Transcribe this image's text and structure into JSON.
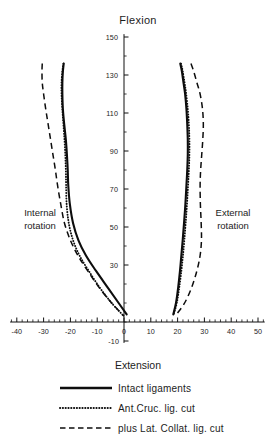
{
  "figure": {
    "title": "Flexion",
    "bottom_axis_label": "Extension",
    "left_region_label_line1": "Internal",
    "left_region_label_line2": "rotation",
    "right_region_label_line1": "External",
    "right_region_label_line2": "rotation",
    "caption": ""
  },
  "legend": {
    "entries": [
      {
        "label": "Intact ligaments",
        "style": "solid",
        "color": "#0d0d0d"
      },
      {
        "label": "Ant.Cruc. lig. cut",
        "style": "dotted",
        "color": "#0d0d0d"
      },
      {
        "label": "plus Lat. Collat. lig. cut",
        "style": "dashed",
        "color": "#0d0d0d"
      }
    ]
  },
  "axes": {
    "x_label": "Extension",
    "x_ticks": [
      "-40",
      "-30",
      "-20",
      "-10",
      "0",
      "10",
      "20",
      "30",
      "40",
      "50"
    ],
    "x_tick_values": [
      -40,
      -30,
      -20,
      -10,
      0,
      10,
      20,
      30,
      40,
      50
    ],
    "x_minor_step": 2,
    "x_range": [
      -44,
      54
    ],
    "y_label": "Flexion",
    "y_ticks": [
      "150",
      "130",
      "110",
      "90",
      "70",
      "50",
      "30",
      "-10"
    ],
    "y_tick_values": [
      150,
      130,
      110,
      90,
      70,
      50,
      30,
      -10
    ],
    "y_minor_step": 10,
    "y_range": [
      -12,
      152
    ],
    "grid": false
  },
  "chart_data": {
    "type": "line",
    "title": "Flexion",
    "xlabel": "Extension",
    "ylabel": "Flexion",
    "xlim": [
      -44,
      54
    ],
    "ylim": [
      -12,
      152
    ],
    "x_ticks": [
      -40,
      -30,
      -20,
      -10,
      0,
      10,
      20,
      30,
      40,
      50
    ],
    "y_ticks": [
      30,
      50,
      70,
      90,
      110,
      130,
      150
    ],
    "grid": false,
    "legend_position": "below",
    "x_axis_note": "Rotation in degrees; negative = internal rotation, positive = external rotation",
    "y_axis_note": "Knee flexion angle in degrees",
    "annotations": [
      {
        "text": "Internal rotation",
        "x": -33,
        "y": 62
      },
      {
        "text": "External rotation",
        "x": 36,
        "y": 62
      },
      {
        "text": "Flexion",
        "x": 0,
        "y": 158
      },
      {
        "text": "Extension",
        "x": 0,
        "y": -22
      }
    ],
    "series": [
      {
        "name": "Intact ligaments",
        "style": "solid",
        "side": "internal",
        "x": [
          -22.5,
          -22.8,
          -23.0,
          -23.0,
          -22.8,
          -22.3,
          -21.7,
          -21.3,
          -21.0,
          -20.8,
          -20.2,
          -19.0,
          -17.0,
          -14.2,
          -10.5,
          -6.0,
          -2.0,
          1.0
        ],
        "y": [
          136,
          132,
          126,
          120,
          112,
          104,
          96,
          88,
          80,
          72,
          62,
          52,
          43,
          35,
          27,
          18,
          10,
          4
        ]
      },
      {
        "name": "Ant.Cruc. lig. cut",
        "style": "dotted",
        "side": "internal",
        "x": [
          -22.6,
          -23.0,
          -23.3,
          -23.3,
          -23.0,
          -22.6,
          -22.2,
          -21.9,
          -21.7,
          -21.6,
          -21.4,
          -20.6,
          -19.0,
          -16.6,
          -13.2,
          -9.0,
          -4.6,
          0.0
        ],
        "y": [
          136,
          132,
          126,
          120,
          112,
          104,
          96,
          88,
          80,
          72,
          62,
          52,
          43,
          35,
          27,
          18,
          10,
          3
        ]
      },
      {
        "name": "plus Lat. Collat. lig. cut",
        "style": "dashed",
        "side": "internal",
        "x": [
          -30.5,
          -30.6,
          -30.5,
          -30.0,
          -29.2,
          -28.3,
          -27.4,
          -26.5,
          -25.6,
          -24.8,
          -23.6,
          -22.2,
          -20.0,
          -17.2,
          -13.6,
          -9.2,
          -4.6,
          0.0
        ],
        "y": [
          136,
          132,
          126,
          120,
          112,
          104,
          96,
          88,
          80,
          72,
          62,
          52,
          43,
          35,
          27,
          18,
          10,
          3
        ]
      },
      {
        "name": "Intact ligaments",
        "style": "solid",
        "side": "external",
        "x": [
          21.0,
          21.6,
          22.2,
          22.8,
          23.3,
          23.6,
          23.8,
          23.8,
          23.6,
          23.3,
          22.9,
          22.4,
          21.9,
          21.4,
          20.9,
          20.2,
          19.4,
          18.4
        ],
        "y": [
          136,
          132,
          126,
          120,
          112,
          104,
          96,
          88,
          80,
          72,
          62,
          52,
          43,
          35,
          27,
          18,
          10,
          4
        ]
      },
      {
        "name": "Ant.Cruc. lig. cut",
        "style": "dotted",
        "side": "external",
        "x": [
          21.3,
          21.9,
          22.6,
          23.2,
          23.8,
          24.2,
          24.4,
          24.4,
          24.2,
          23.9,
          23.5,
          23.0,
          22.5,
          22.0,
          21.4,
          20.6,
          19.7,
          18.5
        ],
        "y": [
          136,
          132,
          126,
          120,
          112,
          104,
          96,
          88,
          80,
          72,
          62,
          52,
          43,
          35,
          27,
          18,
          10,
          4
        ]
      },
      {
        "name": "plus Lat. Collat. lig. cut",
        "style": "dashed",
        "side": "external",
        "x": [
          25.0,
          26.0,
          27.2,
          28.4,
          29.3,
          29.6,
          29.4,
          29.0,
          28.6,
          28.4,
          28.5,
          28.8,
          28.9,
          28.4,
          27.2,
          25.2,
          22.6,
          19.6
        ],
        "y": [
          136,
          132,
          126,
          120,
          112,
          104,
          96,
          88,
          80,
          72,
          62,
          52,
          43,
          35,
          27,
          18,
          10,
          4
        ]
      }
    ]
  }
}
